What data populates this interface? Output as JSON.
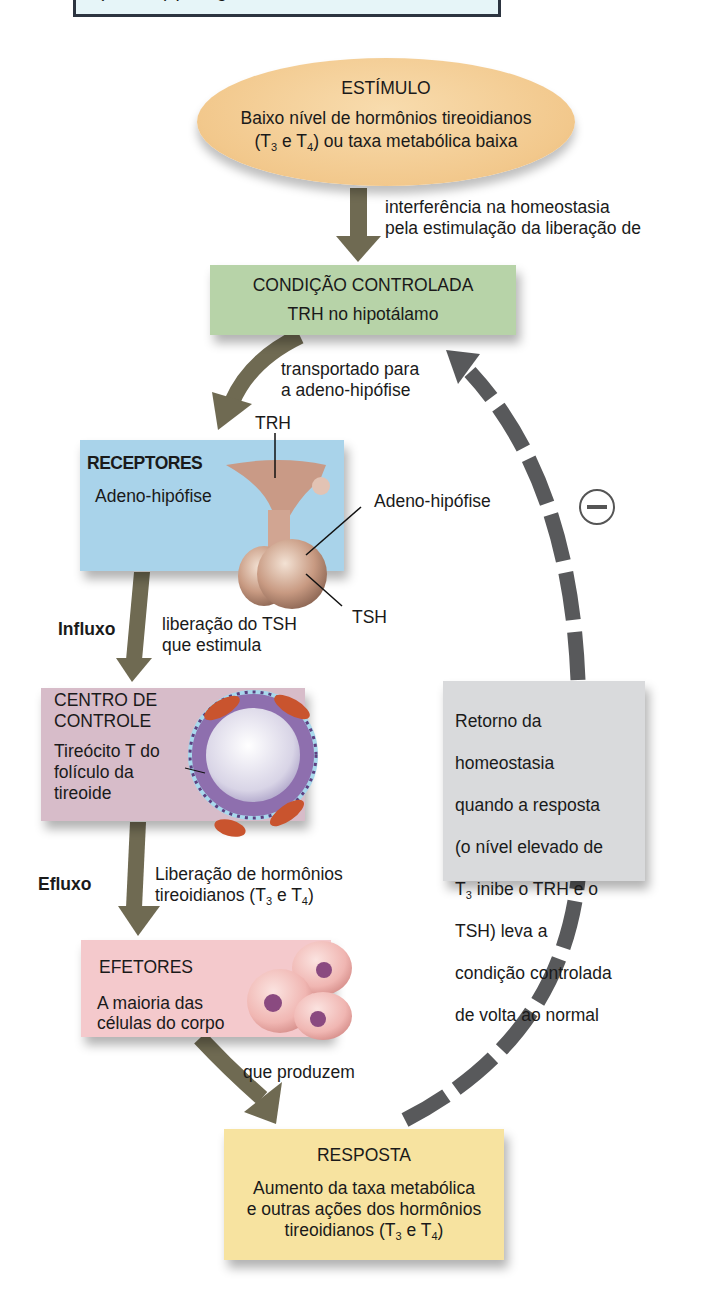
{
  "top_banner": {
    "text": "(T₃ e T₄) pela glândula tireoide."
  },
  "stimulus": {
    "title": "ESTÍMULO",
    "line1": "Baixo nível de hormônios tireoidianos",
    "line2_pre": "(T",
    "line2_sub1": "3",
    "line2_mid": " e T",
    "line2_sub2": "4",
    "line2_post": ") ou taxa metabólica baixa",
    "color": "#f2c88c"
  },
  "arrow_labels": {
    "stim_to_cond_1": "interferência na homeostasia",
    "stim_to_cond_2": "pela estimulação da liberação de",
    "cond_to_recep_1": "transportado para",
    "cond_to_recep_2": "a adeno-hipófise",
    "influx": "Influxo",
    "recep_to_ctrl_1": "liberação do TSH",
    "recep_to_ctrl_2": "que estimula",
    "efflux": "Efluxo",
    "ctrl_to_eff_1": "Liberação de hormônios",
    "ctrl_to_eff_2_pre": "tireoidianos (T",
    "ctrl_to_eff_2_sub1": "3",
    "ctrl_to_eff_2_mid": " e T",
    "ctrl_to_eff_2_sub2": "4",
    "ctrl_to_eff_2_post": ")",
    "eff_to_resp": "que produzem"
  },
  "controlled_condition": {
    "title": "CONDIÇÃO CONTROLADA",
    "subtitle": "TRH no hipotálamo",
    "color": "#b7d3a8"
  },
  "receptors": {
    "title": "RECEPTORES",
    "subtitle": "Adeno-hipófise",
    "color": "#a9d3ea",
    "callouts": {
      "trh": "TRH",
      "adeno": "Adeno-hipófise",
      "tsh": "TSH"
    }
  },
  "control_center": {
    "title_1": "CENTRO DE",
    "title_2": "CONTROLE",
    "desc_1": "Tireócito T do",
    "desc_2": "folículo da",
    "desc_3": "tireoide",
    "color": "#d7bcc9"
  },
  "effectors": {
    "title": "EFETORES",
    "desc_1": "A maioria das",
    "desc_2": "células do corpo",
    "color": "#f4c9cc"
  },
  "feedback": {
    "text_1": "Retorno da",
    "text_2": "homeostasia",
    "text_3": "quando a resposta",
    "text_4": "(o nível elevado de",
    "text_5_pre": "T",
    "text_5_sub": "3",
    "text_5_post": " inibe o TRH e o",
    "text_6": "TSH) leva a",
    "text_7": "condição controlada",
    "text_8": "de volta ao normal",
    "sign": "−",
    "color": "#d9dadc"
  },
  "response": {
    "title": "RESPOSTA",
    "line1": "Aumento da taxa metabólica",
    "line2": "e outras ações dos hormônios",
    "line3_pre": "tireoidianos (T",
    "line3_sub1": "3",
    "line3_mid": " e T",
    "line3_sub2": "4",
    "line3_post": ")",
    "color": "#f7e3a0"
  },
  "colors": {
    "arrow_solid": "#6f6a52",
    "arrow_dashed": "#58595b"
  }
}
